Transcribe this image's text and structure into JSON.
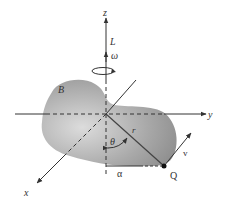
{
  "diagram": {
    "type": "3d-rigid-body-rotation",
    "labels": {
      "z_axis": "z",
      "y_axis": "y",
      "x_axis": "x",
      "angular_momentum": "L",
      "angular_velocity": "ω",
      "body": "B",
      "position_vector": "r",
      "angle": "θ",
      "velocity": "v",
      "distance": "α",
      "point": "Q"
    },
    "colors": {
      "line": "#333333",
      "body_light": "#d8d8d8",
      "body_dark": "#8e8e8e",
      "background": "#ffffff"
    }
  }
}
